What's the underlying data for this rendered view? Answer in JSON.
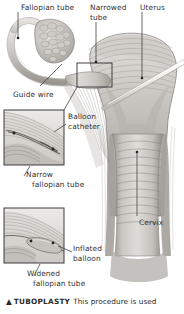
{
  "figure": {
    "type": "medical-anatomical-illustration",
    "palette": {
      "background": "#ffffff",
      "tissue_light": "#d8d6d2",
      "tissue_mid": "#b3b0ab",
      "tissue_dark": "#8b8882",
      "outline": "#6d6a65",
      "text": "#333333",
      "leader_line": "#4a4a4a",
      "inset_border": "#3d3d3d",
      "instrument": "#f2f1ef"
    }
  },
  "labels": {
    "fallopian_tube": "Fallopian tube",
    "narrowed_tube_line1": "Narrowed",
    "narrowed_tube_line2": "tube",
    "uterus": "Uterus",
    "guide_wire": "Guide wire",
    "balloon_catheter_line1": "Balloon",
    "balloon_catheter_line2": "catheter",
    "narrow_fallopian_line1": "Narrow",
    "narrow_fallopian_line2": "fallopian tube",
    "cervix": "Cervix",
    "inflated_balloon_line1": "Inflated",
    "inflated_balloon_line2": "balloon",
    "widened_fallopian_line1": "Widened",
    "widened_fallopian_line2": "fallopian tube"
  },
  "caption": {
    "marker": "▲",
    "heading": "TUBOPLASTY",
    "text": "This procedure is used"
  }
}
